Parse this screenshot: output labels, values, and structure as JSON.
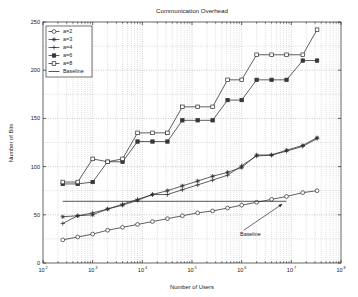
{
  "chart_data": {
    "type": "line",
    "title": "Communication Overhead",
    "xlabel": "Number of Users",
    "ylabel": "Number of Bits",
    "xscale": "log",
    "yscale": "linear",
    "xlim": [
      100,
      100000000
    ],
    "ylim": [
      0,
      250
    ],
    "grid": true,
    "legend_position": "upper left",
    "xtick_labels": [
      "10^2",
      "10^3",
      "10^4",
      "10^5",
      "10^6",
      "10^7",
      "10^8"
    ],
    "xtick_bases": [
      "10",
      "10",
      "10",
      "10",
      "10",
      "10",
      "10"
    ],
    "xtick_exponents": [
      "2",
      "3",
      "4",
      "5",
      "6",
      "7",
      "8"
    ],
    "xtick_values": [
      100,
      1000,
      10000,
      100000,
      1000000,
      10000000,
      100000000
    ],
    "ytick_labels": [
      "0",
      "50",
      "100",
      "150",
      "200",
      "250"
    ],
    "ytick_values": [
      0,
      50,
      100,
      150,
      200,
      250
    ],
    "annotations": [
      {
        "text": "Baseline",
        "x": 1500000,
        "y": 28,
        "arrow_from_x": 1100000,
        "arrow_from_y": 34,
        "arrow_to_x": 6500000,
        "arrow_to_y": 61
      }
    ],
    "series": [
      {
        "name": "a=2",
        "marker": "circle-open",
        "x": [
          250,
          500,
          1000,
          2000,
          4000,
          8000,
          16000,
          32000,
          64000,
          130000,
          260000,
          520000,
          1000000,
          2000000,
          4000000,
          8000000,
          17000000,
          33000000
        ],
        "values": [
          24,
          27,
          30,
          34,
          37,
          40,
          43,
          46,
          49,
          52,
          54,
          57,
          60,
          63,
          66,
          69,
          73,
          75
        ]
      },
      {
        "name": "a=3",
        "marker": "star",
        "x": [
          250,
          500,
          1000,
          2000,
          4000,
          8000,
          16000,
          32000,
          64000,
          130000,
          260000,
          520000,
          1000000,
          2000000,
          4000000,
          8000000,
          17000000,
          33000000
        ],
        "values": [
          48,
          49,
          50,
          56,
          60,
          65,
          71,
          75,
          80,
          85,
          90,
          94,
          99,
          112,
          112,
          117,
          122,
          130
        ]
      },
      {
        "name": "a=4",
        "marker": "plus",
        "x": [
          250,
          500,
          1000,
          2000,
          4000,
          8000,
          16000,
          32000,
          64000,
          130000,
          260000,
          520000,
          1000000,
          2000000,
          4000000,
          8000000,
          17000000,
          33000000
        ],
        "values": [
          41,
          49,
          52,
          56,
          61,
          66,
          71,
          71,
          76,
          81,
          86,
          91,
          101,
          111,
          112,
          116,
          121,
          129
        ]
      },
      {
        "name": "a=6",
        "marker": "square-filled",
        "x": [
          250,
          500,
          1000,
          2000,
          4000,
          8000,
          16000,
          32000,
          64000,
          130000,
          260000,
          520000,
          1000000,
          2000000,
          4000000,
          8000000,
          17000000,
          33000000
        ],
        "values": [
          82,
          82,
          84,
          105,
          105,
          126,
          126,
          126,
          148,
          148,
          148,
          169,
          169,
          190,
          190,
          190,
          210,
          210
        ]
      },
      {
        "name": "a=8",
        "marker": "square-open",
        "x": [
          250,
          500,
          1000,
          2000,
          4000,
          8000,
          16000,
          32000,
          64000,
          130000,
          260000,
          520000,
          1000000,
          2000000,
          4000000,
          8000000,
          17000000,
          33000000
        ],
        "values": [
          84,
          84,
          108,
          105,
          108,
          135,
          135,
          135,
          162,
          162,
          162,
          190,
          190,
          216,
          216,
          216,
          216,
          242
        ]
      },
      {
        "name": "Baseline",
        "marker": "none",
        "x": [
          250,
          8000000
        ],
        "values": [
          64,
          64
        ]
      }
    ],
    "legend_entries": [
      {
        "label": "a=2",
        "marker": "circle-open"
      },
      {
        "label": "a=3",
        "marker": "star"
      },
      {
        "label": "a=4",
        "marker": "plus"
      },
      {
        "label": "a=6",
        "marker": "square-filled"
      },
      {
        "label": "a=8",
        "marker": "square-open"
      },
      {
        "label": "Baseline",
        "marker": "none"
      }
    ]
  }
}
